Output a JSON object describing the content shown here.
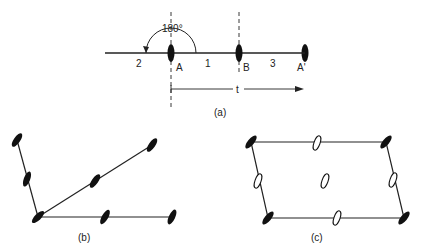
{
  "figure": {
    "panel_a": {
      "caption": "(a)",
      "angle_label": "180°",
      "point_labels": {
        "A": "A",
        "B": "B",
        "A_prime": "A'"
      },
      "segment_labels": {
        "left": "2",
        "middle": "1",
        "right": "3"
      },
      "translation_label": "t"
    },
    "panel_b": {
      "caption": "(b)"
    },
    "panel_c": {
      "caption": "(c)"
    }
  }
}
